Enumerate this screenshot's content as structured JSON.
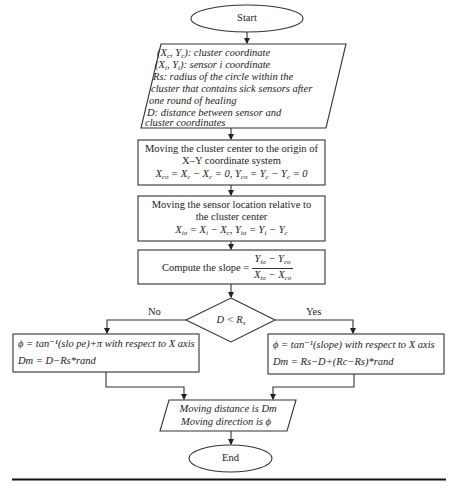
{
  "flowchart": {
    "start": {
      "label": "Start"
    },
    "input": {
      "lines": [
        {
          "var": "(X",
          "sub1": "c",
          "mid": ", Y",
          "sub2": "c",
          "rest": "): cluster coordinate"
        },
        {
          "var": "(X",
          "sub1": "i",
          "mid": ", Y",
          "sub2": "i",
          "rest": "): sensor i coordinate"
        },
        {
          "text": "Rs: radius of the circle within the"
        },
        {
          "text": "cluster that contains sick sensors after"
        },
        {
          "text": "one round of healing"
        },
        {
          "text": "D: distance between sensor and"
        },
        {
          "text": "cluster coordinates"
        }
      ]
    },
    "step1": {
      "line1": "Moving the cluster center to the origin of",
      "line2": "X–Y coordinate system",
      "formula": "X_co = X_c − X_c = 0, Y_co = Y_c − Y_c = 0"
    },
    "step2": {
      "line1": "Moving the sensor location relative to",
      "line2": "the cluster center",
      "formula": "X_io = X_i − X_c, Y_io = Y_i − Y_c"
    },
    "step3": {
      "label": "Compute the slope =",
      "numerator": "Y_io − Y_co",
      "denominator": "X_io − X_co"
    },
    "decision": {
      "condition": "D < R_s",
      "no_label": "No",
      "yes_label": "Yes"
    },
    "no_branch": {
      "line1": "ϕ = tan⁻¹(slo pe)+π  with respect to X axis",
      "line2": "Dm = D−Rs*rand"
    },
    "yes_branch": {
      "line1": "ϕ = tan⁻¹(slope) with respect to X axis",
      "line2": "Dm = Rs−D+(Rc−Rs)*rand"
    },
    "output": {
      "line1": "Moving distance is Dm",
      "line2": "Moving direction is ϕ"
    },
    "end": {
      "label": "End"
    }
  }
}
